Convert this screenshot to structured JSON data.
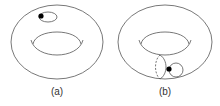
{
  "figure": {
    "panels": [
      {
        "label": "(a)",
        "description": "torus with a small contractible loop on its surface and a base point"
      },
      {
        "label": "(b)",
        "description": "torus with a meridian circle (dashed back half) and a small loop attached at a base point"
      }
    ],
    "colors": {
      "stroke": "#555555",
      "point": "#000000",
      "background": "#ffffff"
    }
  }
}
